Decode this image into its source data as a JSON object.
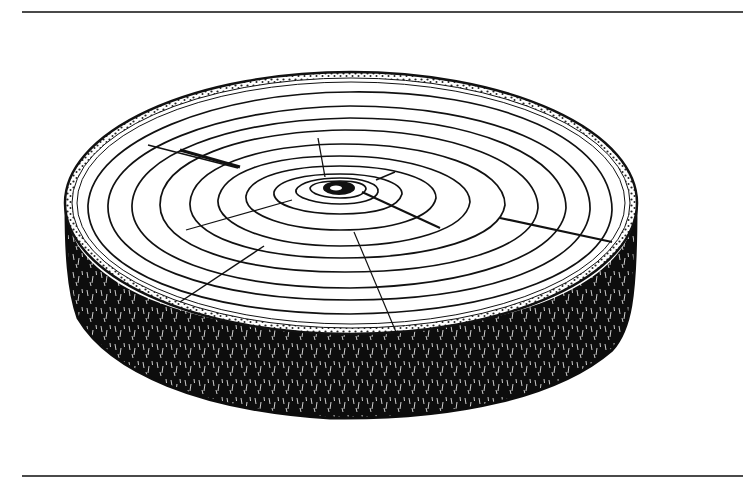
{
  "illustration": {
    "subject": "tree trunk cross-section (log slice) with growth rings",
    "style": "pen-and-ink line drawing",
    "colors": {
      "ink": "#111111",
      "background": "#ffffff",
      "rule": "#4a4a4a"
    },
    "ring_count": 11,
    "radial_crack_count": 6
  },
  "layout": {
    "top_rule_y": 12,
    "bottom_rule_y": 476
  }
}
